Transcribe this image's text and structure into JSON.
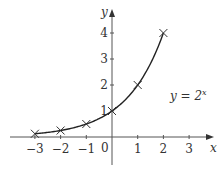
{
  "chart_data": {
    "type": "line",
    "title": "",
    "xlabel": "x",
    "ylabel": "y",
    "annotation": "y = 2^x",
    "annotation_parts": {
      "lhs": "y = 2",
      "exp": "x"
    },
    "origin_label": "0",
    "x_ticks": [
      -3,
      -2,
      -1,
      1,
      2,
      3
    ],
    "x_tick_labels": [
      "−3",
      "−2",
      "−1",
      "1",
      "2",
      "3"
    ],
    "y_ticks": [
      1,
      2,
      3,
      4
    ],
    "y_tick_labels": [
      "1",
      "2",
      "3",
      "4"
    ],
    "xlim": [
      -4.2,
      4.1
    ],
    "ylim": [
      -0.9,
      5.3
    ],
    "grid": false,
    "series": [
      {
        "name": "y = 2^x",
        "marker": "x",
        "x": [
          -3,
          -2,
          -1,
          0,
          1,
          2
        ],
        "values": [
          0.125,
          0.25,
          0.5,
          1,
          2,
          4
        ]
      }
    ]
  }
}
